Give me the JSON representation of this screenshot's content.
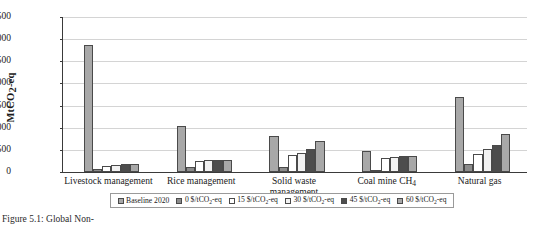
{
  "chart_data": {
    "type": "bar",
    "title": "",
    "xlabel": "",
    "ylabel": "MtCO2-eq",
    "ylabel_parts": {
      "pre": "MtCO",
      "sub": "2",
      "post": "-eq"
    },
    "ylim": [
      0,
      3500
    ],
    "yticks": [
      0,
      500,
      1000,
      1500,
      2000,
      2500,
      3000,
      3500
    ],
    "ytick_labels": [
      "0",
      "500",
      "1,000",
      "1,500",
      "2,000",
      "2,500",
      "3,000",
      "3,500"
    ],
    "grid": true,
    "legend_position": "bottom",
    "categories": [
      "Livestock management",
      "Rice management",
      "Solid waste management",
      "Coal mine CH4",
      "Natural gas"
    ],
    "category_labels": [
      {
        "line1": "Livestock management",
        "line2": ""
      },
      {
        "line1": "Rice management",
        "line2": ""
      },
      {
        "line1": "Solid waste",
        "line2": "management"
      },
      {
        "line1": "Coal mine CH",
        "sub": "4",
        "line2": ""
      },
      {
        "line1": "Natural gas",
        "line2": ""
      }
    ],
    "series": [
      {
        "name": "Baseline 2020",
        "color": "#a8a8a8",
        "values": [
          2870,
          1050,
          820,
          470,
          1690
        ]
      },
      {
        "name": "0 $/tCO2-eq",
        "color": "#8c8c8c",
        "values": [
          70,
          110,
          110,
          35,
          170
        ]
      },
      {
        "name": "15 $/tCO2-eq",
        "color": "#ffffff",
        "values": [
          140,
          250,
          380,
          310,
          400
        ]
      },
      {
        "name": "30 $/tCO2-eq",
        "color": "#f2f2f2",
        "values": [
          150,
          265,
          430,
          330,
          530
        ]
      },
      {
        "name": "45 $/tCO2-eq",
        "color": "#4d4d4d",
        "values": [
          185,
          275,
          520,
          355,
          600
        ]
      },
      {
        "name": "60 $/tCO2-eq",
        "color": "#a8a8a8",
        "values": [
          185,
          280,
          690,
          370,
          860
        ]
      }
    ],
    "legend": [
      {
        "label": "Baseline 2020",
        "pre": "Baseline 2020",
        "sub": "",
        "post": ""
      },
      {
        "label": "0 $/tCO2-eq",
        "pre": "0 $/tCO",
        "sub": "2",
        "post": "-eq"
      },
      {
        "label": "15 $/tCO2-eq",
        "pre": "15 $/tCO",
        "sub": "2",
        "post": "-eq"
      },
      {
        "label": "30 $/tCO2-eq",
        "pre": "30 $/tCO",
        "sub": "2",
        "post": "-eq"
      },
      {
        "label": "45 $/tCO2-eq",
        "pre": "45 $/tCO",
        "sub": "2",
        "post": "-eq"
      },
      {
        "label": "60 $/tCO2-eq",
        "pre": "60 $/tCO",
        "sub": "2",
        "post": "-eq"
      }
    ]
  },
  "caption": "Figure 5.1: Global Non-"
}
